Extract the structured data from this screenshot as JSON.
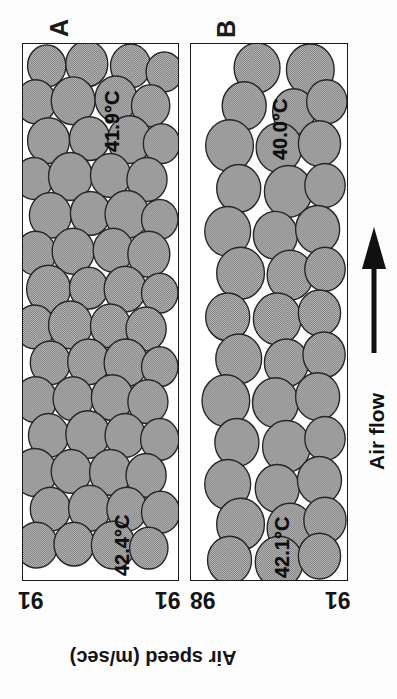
{
  "figure": {
    "orientation_note": "rotated-scan",
    "background_color": "#fdfdfd",
    "particle_fill": "#a9a9a9",
    "particle_stroke": "#262626",
    "panel_border_color": "#1a1a1a"
  },
  "panels": [
    {
      "id": "A",
      "letter": "A",
      "temperature_top": "41.9°C",
      "temperature_bottom": "42.4°C",
      "tick_left": "91",
      "tick_right": "91"
    },
    {
      "id": "B",
      "letter": "B",
      "temperature_top": "40.0°C",
      "temperature_bottom": "42.1°C",
      "tick_left": "98",
      "tick_right": "91"
    }
  ],
  "axis": {
    "title": "Air speed (m/sec)"
  },
  "airflow": {
    "label": "Air flow",
    "arrow_direction": "up"
  },
  "chart_data": {
    "type": "diagram",
    "title": "Air speed (m/sec)",
    "panels": [
      {
        "label": "A",
        "temperatures": [
          "41.9°C",
          "42.4°C"
        ],
        "air_speeds": [
          91,
          91
        ],
        "particle_count": 56,
        "packing": "dense"
      },
      {
        "label": "B",
        "temperatures": [
          "40.0°C",
          "42.1°C"
        ],
        "air_speeds": [
          98,
          91
        ],
        "particle_count": 44,
        "packing": "channelled"
      }
    ],
    "xlabel": "Air speed (m/sec)",
    "ylabel": "",
    "legend": [],
    "annotations": [
      "Air flow"
    ]
  },
  "particles": {
    "panel_a": [
      [
        26,
        22,
        21
      ],
      [
        70,
        20,
        23
      ],
      [
        118,
        22,
        22
      ],
      [
        155,
        28,
        20
      ],
      [
        14,
        58,
        22
      ],
      [
        55,
        57,
        24
      ],
      [
        102,
        55,
        23
      ],
      [
        140,
        62,
        21
      ],
      [
        28,
        97,
        23
      ],
      [
        73,
        95,
        22
      ],
      [
        117,
        96,
        24
      ],
      [
        152,
        100,
        20
      ],
      [
        12,
        135,
        21
      ],
      [
        52,
        133,
        24
      ],
      [
        96,
        132,
        22
      ],
      [
        136,
        136,
        22
      ],
      [
        30,
        172,
        23
      ],
      [
        74,
        170,
        22
      ],
      [
        114,
        171,
        24
      ],
      [
        150,
        176,
        20
      ],
      [
        14,
        210,
        22
      ],
      [
        55,
        208,
        23
      ],
      [
        99,
        207,
        22
      ],
      [
        138,
        211,
        23
      ],
      [
        28,
        246,
        24
      ],
      [
        72,
        245,
        21
      ],
      [
        112,
        246,
        23
      ],
      [
        150,
        250,
        20
      ],
      [
        13,
        284,
        22
      ],
      [
        52,
        282,
        24
      ],
      [
        96,
        283,
        22
      ],
      [
        135,
        286,
        22
      ],
      [
        30,
        320,
        22
      ],
      [
        72,
        319,
        23
      ],
      [
        113,
        320,
        24
      ],
      [
        150,
        324,
        20
      ],
      [
        14,
        357,
        23
      ],
      [
        55,
        356,
        22
      ],
      [
        98,
        355,
        23
      ],
      [
        137,
        359,
        22
      ],
      [
        28,
        393,
        22
      ],
      [
        71,
        392,
        24
      ],
      [
        112,
        393,
        22
      ],
      [
        150,
        397,
        21
      ],
      [
        13,
        430,
        24
      ],
      [
        53,
        429,
        22
      ],
      [
        96,
        430,
        23
      ],
      [
        135,
        433,
        22
      ],
      [
        30,
        467,
        22
      ],
      [
        73,
        466,
        23
      ],
      [
        114,
        467,
        22
      ],
      [
        151,
        470,
        21
      ],
      [
        15,
        503,
        23
      ],
      [
        56,
        502,
        22
      ],
      [
        99,
        503,
        24
      ],
      [
        138,
        506,
        21
      ]
    ],
    "panel_b": [
      [
        72,
        24,
        25
      ],
      [
        130,
        26,
        26
      ],
      [
        58,
        62,
        24
      ],
      [
        112,
        68,
        23
      ],
      [
        148,
        58,
        22
      ],
      [
        42,
        102,
        26
      ],
      [
        96,
        104,
        25
      ],
      [
        140,
        100,
        23
      ],
      [
        52,
        145,
        24
      ],
      [
        106,
        148,
        26
      ],
      [
        146,
        142,
        22
      ],
      [
        40,
        188,
        25
      ],
      [
        92,
        192,
        24
      ],
      [
        138,
        186,
        24
      ],
      [
        54,
        230,
        26
      ],
      [
        108,
        232,
        25
      ],
      [
        146,
        226,
        22
      ],
      [
        40,
        274,
        24
      ],
      [
        94,
        276,
        26
      ],
      [
        140,
        270,
        23
      ],
      [
        52,
        316,
        25
      ],
      [
        104,
        320,
        24
      ],
      [
        145,
        312,
        23
      ],
      [
        38,
        358,
        26
      ],
      [
        92,
        360,
        25
      ],
      [
        138,
        354,
        24
      ],
      [
        50,
        400,
        24
      ],
      [
        104,
        404,
        26
      ],
      [
        146,
        396,
        22
      ],
      [
        40,
        442,
        25
      ],
      [
        94,
        446,
        24
      ],
      [
        140,
        438,
        24
      ],
      [
        54,
        482,
        26
      ],
      [
        108,
        486,
        25
      ],
      [
        146,
        478,
        23
      ],
      [
        42,
        518,
        24
      ],
      [
        96,
        520,
        26
      ],
      [
        140,
        514,
        23
      ]
    ]
  }
}
